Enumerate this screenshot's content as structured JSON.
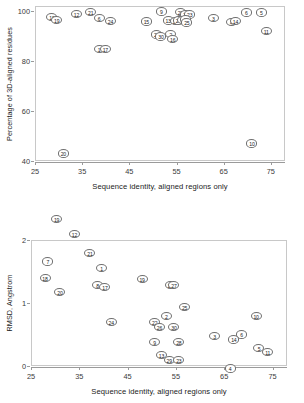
{
  "figure": {
    "background": "#ffffff",
    "marker_edge": "#6f6f6f",
    "axis_color": "#9a9a9a",
    "frame_color": "#c8c8c8"
  },
  "chart_data": [
    {
      "id": "top",
      "type": "scatter",
      "title": "",
      "xlabel": "Sequence identity, aligned regions only",
      "ylabel": "Percentage of 3D-aligned residues",
      "xlim": [
        25,
        78
      ],
      "ylim": [
        40,
        102
      ],
      "xticks": [
        25,
        35,
        45,
        55,
        65,
        75
      ],
      "yticks": [
        40,
        60,
        80,
        100
      ],
      "grid": false,
      "legend": "none",
      "point_label_key": "protein number",
      "points": [
        {
          "label": "18",
          "x": 28.6,
          "y": 97.5
        },
        {
          "label": "19",
          "x": 29.6,
          "y": 96.3
        },
        {
          "label": "12",
          "x": 33.8,
          "y": 98.8
        },
        {
          "label": "21",
          "x": 36.8,
          "y": 99.6
        },
        {
          "label": "6",
          "x": 38.6,
          "y": 97.2
        },
        {
          "label": "24",
          "x": 41.0,
          "y": 96.0
        },
        {
          "label": "20",
          "x": 31.0,
          "y": 43.0
        },
        {
          "label": "1",
          "x": 38.6,
          "y": 84.8
        },
        {
          "label": "17",
          "x": 39.9,
          "y": 84.8
        },
        {
          "label": "15",
          "x": 48.6,
          "y": 95.8
        },
        {
          "label": "9",
          "x": 51.8,
          "y": 99.8
        },
        {
          "label": "13",
          "x": 53.2,
          "y": 96.2
        },
        {
          "label": "22",
          "x": 50.8,
          "y": 90.6
        },
        {
          "label": "30",
          "x": 51.7,
          "y": 89.8
        },
        {
          "label": "2",
          "x": 53.8,
          "y": 90.8
        },
        {
          "label": "16",
          "x": 54.2,
          "y": 88.9
        },
        {
          "label": "29",
          "x": 55.8,
          "y": 99.6
        },
        {
          "label": "27",
          "x": 57.0,
          "y": 98.6
        },
        {
          "label": "23",
          "x": 57.8,
          "y": 98.6
        },
        {
          "label": "28",
          "x": 54.8,
          "y": 96.0
        },
        {
          "label": "26",
          "x": 55.4,
          "y": 96.2
        },
        {
          "label": "7",
          "x": 56.2,
          "y": 96.4
        },
        {
          "label": "8",
          "x": 56.8,
          "y": 96.6
        },
        {
          "label": "25",
          "x": 57.2,
          "y": 95.4
        },
        {
          "label": "3",
          "x": 62.8,
          "y": 97.2
        },
        {
          "label": "4",
          "x": 66.6,
          "y": 95.6
        },
        {
          "label": "14",
          "x": 67.5,
          "y": 96.0
        },
        {
          "label": "6",
          "x": 69.8,
          "y": 99.4
        },
        {
          "label": "5",
          "x": 73.0,
          "y": 99.4
        },
        {
          "label": "11",
          "x": 74.0,
          "y": 92.0
        },
        {
          "label": "10",
          "x": 71.0,
          "y": 47.0
        }
      ]
    },
    {
      "id": "bottom",
      "type": "scatter",
      "title": "",
      "xlabel": "Sequence identity, aligned regions only",
      "ylabel": "RMSD, Angstrom",
      "xlim": [
        25,
        78
      ],
      "ylim": [
        0,
        2
      ],
      "xticks": [
        25,
        35,
        45,
        55,
        65,
        75
      ],
      "yticks": [
        0,
        1,
        2
      ],
      "grid": false,
      "legend": "none",
      "point_label_key": "protein number",
      "points": [
        {
          "label": "19",
          "x": 30.3,
          "y": 2.33
        },
        {
          "label": "12",
          "x": 34.0,
          "y": 2.09
        },
        {
          "label": "21",
          "x": 37.2,
          "y": 1.8
        },
        {
          "label": "7",
          "x": 28.5,
          "y": 1.66
        },
        {
          "label": "1",
          "x": 39.6,
          "y": 1.56
        },
        {
          "label": "18",
          "x": 27.9,
          "y": 1.4
        },
        {
          "label": "19",
          "x": 48.0,
          "y": 1.38
        },
        {
          "label": "8",
          "x": 38.8,
          "y": 1.28
        },
        {
          "label": "17",
          "x": 40.3,
          "y": 1.26
        },
        {
          "label": "16",
          "x": 53.8,
          "y": 1.28
        },
        {
          "label": "27",
          "x": 54.6,
          "y": 1.28
        },
        {
          "label": "20",
          "x": 31.0,
          "y": 1.17
        },
        {
          "label": "25",
          "x": 56.8,
          "y": 0.93
        },
        {
          "label": "2",
          "x": 53.0,
          "y": 0.8
        },
        {
          "label": "10",
          "x": 71.6,
          "y": 0.8
        },
        {
          "label": "24",
          "x": 41.6,
          "y": 0.7
        },
        {
          "label": "22",
          "x": 50.6,
          "y": 0.7
        },
        {
          "label": "26",
          "x": 51.6,
          "y": 0.62
        },
        {
          "label": "30",
          "x": 54.6,
          "y": 0.62
        },
        {
          "label": "3",
          "x": 63.0,
          "y": 0.48
        },
        {
          "label": "6",
          "x": 68.6,
          "y": 0.5
        },
        {
          "label": "14",
          "x": 67.0,
          "y": 0.42
        },
        {
          "label": "9",
          "x": 50.6,
          "y": 0.38
        },
        {
          "label": "28",
          "x": 55.6,
          "y": 0.38
        },
        {
          "label": "5",
          "x": 72.2,
          "y": 0.29
        },
        {
          "label": "11",
          "x": 74.0,
          "y": 0.22
        },
        {
          "label": "13",
          "x": 52.0,
          "y": 0.18
        },
        {
          "label": "29",
          "x": 53.6,
          "y": 0.09
        },
        {
          "label": "23",
          "x": 55.6,
          "y": 0.09
        },
        {
          "label": "4",
          "x": 66.2,
          "y": -0.04
        }
      ]
    }
  ]
}
